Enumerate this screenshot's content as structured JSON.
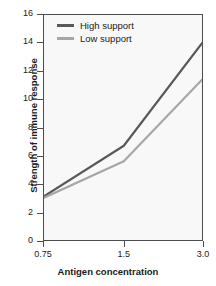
{
  "chart_data": {
    "type": "line",
    "title": "",
    "xlabel": "Antigen concentration",
    "ylabel": "Strength of immune response",
    "categories": [
      "0.75",
      "1.5",
      "3.0"
    ],
    "x_tick_labels": [
      "0.75",
      "1.5",
      "3.0"
    ],
    "y_tick_labels": [
      "0",
      "2",
      "4",
      "6",
      "8",
      "10",
      "12",
      "14",
      "16"
    ],
    "y_ticks": [
      0,
      2,
      4,
      6,
      8,
      10,
      12,
      14,
      16
    ],
    "ylim": [
      0,
      16
    ],
    "grid": false,
    "legend_position": "top-left-inside",
    "series": [
      {
        "name": "High support",
        "color": "#595959",
        "values": [
          3.1,
          6.7,
          14.0
        ]
      },
      {
        "name": "Low support",
        "color": "#a6a6a6",
        "values": [
          3.0,
          5.6,
          11.4
        ]
      }
    ]
  },
  "legend": {
    "items": [
      {
        "label": "High support"
      },
      {
        "label": "Low support"
      }
    ]
  },
  "axes": {
    "x_title": "Antigen concentration",
    "y_title": "Strength of immune response"
  },
  "colors": {
    "high_support": "#595959",
    "low_support": "#a6a6a6",
    "axis": "#4d4d4d",
    "panel_background": "#f8f8f8",
    "text": "#1a1a1a"
  }
}
